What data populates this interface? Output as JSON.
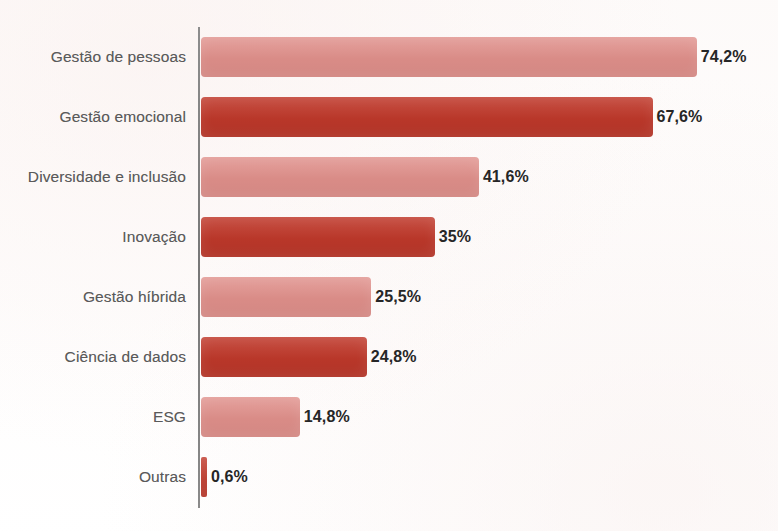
{
  "chart_data": {
    "type": "bar",
    "orientation": "horizontal",
    "title": "",
    "subtitle": "",
    "xlabel": "",
    "ylabel": "",
    "xlim": [
      0,
      80
    ],
    "grid": false,
    "legend": null,
    "value_suffix": "%",
    "decimal_separator": ",",
    "categories": [
      "Gestão de pessoas",
      "Gestão emocional",
      "Diversidade e inclusão",
      "Inovação",
      "Gestão híbrida",
      "Ciência de dados",
      "ESG",
      "Outras"
    ],
    "values": [
      74.2,
      67.6,
      41.6,
      35,
      25.5,
      24.8,
      14.8,
      0.6
    ],
    "value_labels": [
      "74,2%",
      "67,6%",
      "41,6%",
      "35%",
      "25,5%",
      "24,8%",
      "14,8%",
      "0,6%"
    ],
    "bar_colors": [
      "#e0908b",
      "#c0392b",
      "#e0908b",
      "#c0392b",
      "#e0908b",
      "#c0392b",
      "#e0908b",
      "#c0392b"
    ],
    "bar_shades": [
      "light",
      "dark",
      "light",
      "dark",
      "light",
      "dark",
      "light",
      "dark"
    ],
    "colors": {
      "light_red": "#e0908b",
      "dark_red": "#c0392b",
      "axis_line": "#808080",
      "category_label": "#5a5a5a",
      "value_label": "#262626",
      "background": "#fdfcfc"
    },
    "axis": {
      "show_value_axis": false,
      "show_category_axis_line": true
    }
  }
}
